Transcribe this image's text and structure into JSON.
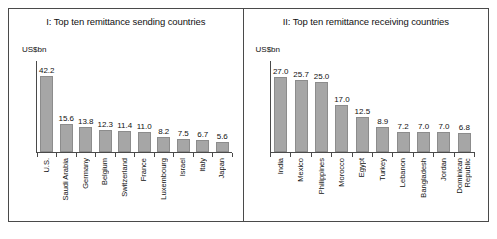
{
  "figure": {
    "unit_label": "US$bn"
  },
  "chart_data": [
    {
      "type": "bar",
      "title": "I: Top ten remittance sending countries",
      "xlabel": "",
      "ylabel": "US$bn",
      "ylim": [
        0,
        45
      ],
      "grid": false,
      "legend": "none",
      "categories": [
        "U.S.",
        "Saudi Arabia",
        "Germany",
        "Belgium",
        "Switzerland",
        "France",
        "Luxembourg",
        "Israel",
        "Italy",
        "Japan"
      ],
      "values": [
        42.2,
        15.6,
        13.8,
        12.3,
        11.4,
        11.0,
        8.2,
        7.5,
        6.7,
        5.6
      ],
      "value_labels": [
        "42.2",
        "15.6",
        "13.8",
        "12.3",
        "11.4",
        "11.0",
        "8.2",
        "7.5",
        "6.7",
        "5.6"
      ]
    },
    {
      "type": "bar",
      "title": "II: Top ten remittance receiving countries",
      "xlabel": "",
      "ylabel": "US$bn",
      "ylim": [
        0,
        29
      ],
      "grid": false,
      "legend": "none",
      "categories": [
        "India",
        "Mexico",
        "Philippines",
        "Morocco",
        "Egypt",
        "Turkey",
        "Lebanon",
        "Bangladesh",
        "Jordan",
        "Dominican\nRepublic"
      ],
      "values": [
        27.0,
        25.7,
        25.0,
        17.0,
        12.5,
        8.9,
        7.2,
        7.0,
        7.0,
        6.8
      ],
      "value_labels": [
        "27.0",
        "25.7",
        "25.0",
        "17.0",
        "12.5",
        "8.9",
        "7.2",
        "7.0",
        "7.0",
        "6.8"
      ]
    }
  ],
  "colors": {
    "bar_fill": "#a6a6a6",
    "bar_stroke": "#8c8c8c",
    "axis": "#4a4a4a",
    "text": "#111111",
    "background": "#ffffff"
  }
}
